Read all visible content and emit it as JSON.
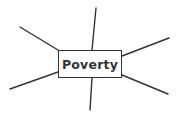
{
  "diagram": {
    "type": "mind-map",
    "center": {
      "label": "Poverty"
    },
    "colors": {
      "line": "#333333",
      "text": "#333333",
      "box_border": "#333333",
      "background": "#ffffff"
    },
    "branches": [
      {
        "name": "top",
        "x1": 92,
        "y1": 50,
        "x2": 96,
        "y2": 8,
        "label": ""
      },
      {
        "name": "top-left",
        "x1": 58,
        "y1": 50,
        "x2": 20,
        "y2": 27,
        "label": ""
      },
      {
        "name": "top-right",
        "x1": 122,
        "y1": 56,
        "x2": 169,
        "y2": 38,
        "label": ""
      },
      {
        "name": "bottom-left",
        "x1": 58,
        "y1": 72,
        "x2": 10,
        "y2": 89,
        "label": ""
      },
      {
        "name": "bottom-right",
        "x1": 122,
        "y1": 75,
        "x2": 168,
        "y2": 94,
        "label": ""
      },
      {
        "name": "bottom",
        "x1": 92,
        "y1": 78,
        "x2": 90,
        "y2": 110,
        "label": ""
      }
    ]
  }
}
